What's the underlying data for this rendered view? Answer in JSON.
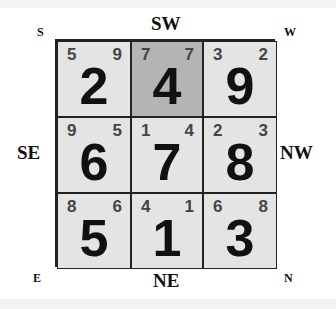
{
  "directions": {
    "top_left": "S",
    "top": "SW",
    "top_right": "W",
    "left": "SE",
    "right": "NW",
    "bottom_left": "E",
    "bottom": "NE",
    "bottom_right": "N"
  },
  "grid": {
    "highlight_color": "#b4b4b4",
    "cell_color": "#e4e4e4",
    "cells": [
      {
        "main": "2",
        "left": "5",
        "right": "9",
        "highlighted": false
      },
      {
        "main": "4",
        "left": "7",
        "right": "7",
        "highlighted": true
      },
      {
        "main": "9",
        "left": "3",
        "right": "2",
        "highlighted": false
      },
      {
        "main": "6",
        "left": "9",
        "right": "5",
        "highlighted": false
      },
      {
        "main": "7",
        "left": "1",
        "right": "4",
        "highlighted": false
      },
      {
        "main": "8",
        "left": "2",
        "right": "3",
        "highlighted": false
      },
      {
        "main": "5",
        "left": "8",
        "right": "6",
        "highlighted": false
      },
      {
        "main": "1",
        "left": "4",
        "right": "1",
        "highlighted": false
      },
      {
        "main": "3",
        "left": "6",
        "right": "8",
        "highlighted": false
      }
    ]
  }
}
